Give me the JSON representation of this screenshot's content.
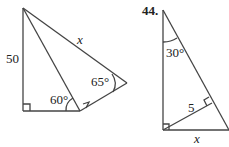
{
  "figures": [
    {
      "id": "left-figure",
      "labels": {
        "side_left": "50",
        "side_hyp": "x",
        "angle_bottom": "60°",
        "angle_right": "65°"
      }
    },
    {
      "id": "right-figure",
      "problem_number": "44.",
      "labels": {
        "angle_top": "30°",
        "altitude": "5",
        "side_bottom": "x"
      }
    }
  ]
}
